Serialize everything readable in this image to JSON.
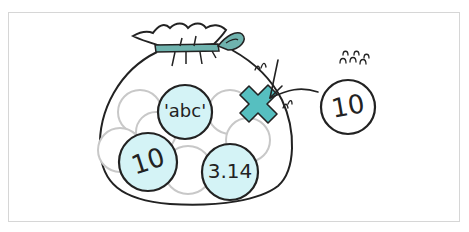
{
  "diagram": {
    "bag_items": [
      {
        "label": "'abc'"
      },
      {
        "label": "10"
      },
      {
        "label": "3.14"
      }
    ],
    "outside_item": {
      "label": "10"
    },
    "reject_mark": "x-mark",
    "colors": {
      "fill": "#d4f3f6",
      "accent": "#56bfc0",
      "ribbon": "#6fb3ae",
      "stroke": "#222222",
      "empty_slot": "#c8c8c8",
      "frame": "#d6d6d6"
    }
  }
}
